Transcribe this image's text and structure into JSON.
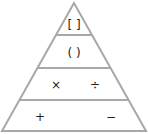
{
  "diagram": {
    "stroke_color": "#a8a8a8",
    "levels": [
      {
        "name": "brackets",
        "symbols": [
          "[ ]"
        ]
      },
      {
        "name": "parentheses",
        "symbols": [
          "( )"
        ]
      },
      {
        "name": "multiply-divide",
        "symbols": [
          "×",
          "÷"
        ]
      },
      {
        "name": "add-subtract",
        "symbols": [
          "+",
          "−"
        ]
      }
    ]
  }
}
